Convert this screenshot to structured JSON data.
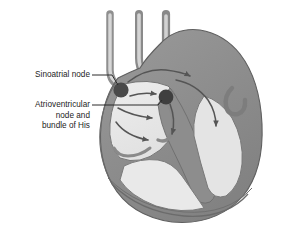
{
  "figure": {
    "name": "cardiac-conduction-system",
    "background_color": "#ffffff"
  },
  "labels": {
    "sinoatrial": {
      "text": "Sinoatrial node",
      "lines": [
        "Sinoatrial node"
      ]
    },
    "atrioventricular": {
      "text": "Atrioventricular node and bundle of His",
      "lines": [
        "Atrioventricular",
        "node and",
        "bundle of His"
      ]
    }
  },
  "nodes": [
    {
      "name": "sinoatrial-node",
      "label": "Sinoatrial node",
      "cx": 121,
      "cy": 90,
      "r": 7.6
    },
    {
      "name": "atrioventricular-node",
      "label": "Atrioventricular node",
      "cx": 166,
      "cy": 97,
      "r": 7.4
    }
  ],
  "colors": {
    "background": "#ffffff",
    "text": "#1d1d1d",
    "leader_line": "#2a2a2a",
    "node_fill": "#4a4a4a",
    "myocardium_wall": "#8e8e8e",
    "myocardium_wall_dark": "#7a7a7a",
    "chamber_fill": "#e6e6e6",
    "chamber_fill_light": "#ececec",
    "vessel_fill": "#9a9a9a",
    "vessel_light": "#d5d5d5",
    "outline": "#6f6f6f",
    "arrow": "#555555"
  },
  "annotations": {
    "leader_sinoatrial": {
      "x1": 92,
      "y1": 75,
      "x2": 118,
      "y2": 85
    },
    "leader_atrioventricular": {
      "x1": 92,
      "y1": 105,
      "x2": 161,
      "y2": 99
    }
  },
  "arrows": [
    {
      "name": "conduction-arrow-to-av",
      "description": "SA node to AV node"
    },
    {
      "name": "conduction-arrow-upper-right",
      "description": "toward upper right atrium"
    },
    {
      "name": "conduction-arrow-mid",
      "description": "mid atrial spread"
    },
    {
      "name": "conduction-arrow-lower",
      "description": "lower atrial spread"
    },
    {
      "name": "conduction-arrow-bundle",
      "description": "bundle of His descending"
    },
    {
      "name": "conduction-arrow-right-ventricle",
      "description": "right bundle branch"
    }
  ]
}
